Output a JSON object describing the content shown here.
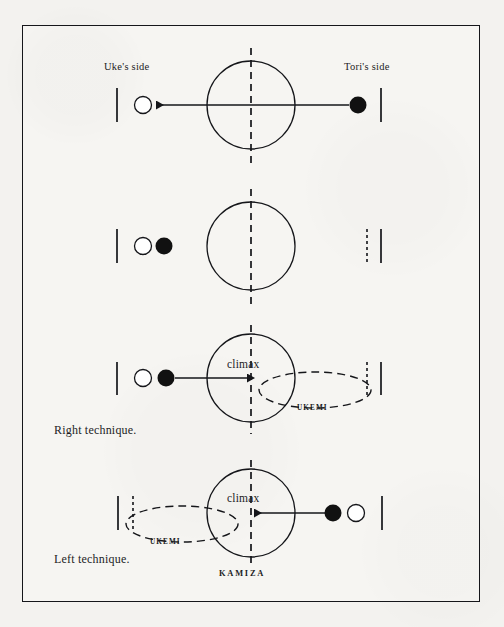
{
  "figure": {
    "title_labels": {
      "uke_side": "Uke's side",
      "tori_side": "Tori's side"
    },
    "colors": {
      "ink": "#15161a",
      "paper": "#f3f2ef",
      "frame": "#15161a",
      "black_marker": "#111111",
      "white_marker": "#ffffff"
    },
    "center_label": "KAMIZA",
    "rows": [
      {
        "id": "row-1",
        "caption": "",
        "climax": "",
        "ukemi": "",
        "arrow_direction": "left",
        "markers": [
          {
            "type": "tick",
            "style": "solid",
            "x": 117
          },
          {
            "type": "circle",
            "fill": "white",
            "x": 143
          },
          {
            "type": "circle",
            "fill": "black",
            "x": 358
          },
          {
            "type": "tick",
            "style": "solid",
            "x": 381
          }
        ]
      },
      {
        "id": "row-2",
        "caption": "",
        "climax": "",
        "ukemi": "",
        "arrow_direction": "none",
        "markers": [
          {
            "type": "tick",
            "style": "solid",
            "x": 117
          },
          {
            "type": "circle",
            "fill": "white",
            "x": 143
          },
          {
            "type": "circle",
            "fill": "black",
            "x": 165
          },
          {
            "type": "tick",
            "style": "dashed",
            "x": 367
          },
          {
            "type": "tick",
            "style": "solid",
            "x": 381
          }
        ]
      },
      {
        "id": "row-3",
        "caption": "Right technique.",
        "climax": "climax",
        "ukemi": "UKEMI",
        "arrow_direction": "right",
        "markers": [
          {
            "type": "tick",
            "style": "solid",
            "x": 117
          },
          {
            "type": "circle",
            "fill": "white",
            "x": 143
          },
          {
            "type": "circle",
            "fill": "black",
            "x": 166
          },
          {
            "type": "ellipse",
            "style": "dashed",
            "x": 315
          },
          {
            "type": "tick",
            "style": "dashed",
            "x": 367
          },
          {
            "type": "tick",
            "style": "solid",
            "x": 381
          }
        ]
      },
      {
        "id": "row-4",
        "caption": "Left technique.",
        "climax": "climax",
        "ukemi": "UKEMI",
        "arrow_direction": "left",
        "markers": [
          {
            "type": "tick",
            "style": "solid",
            "x": 118
          },
          {
            "type": "tick",
            "style": "dashed",
            "x": 133
          },
          {
            "type": "ellipse",
            "style": "dashed",
            "x": 180
          },
          {
            "type": "circle",
            "fill": "black",
            "x": 333
          },
          {
            "type": "circle",
            "fill": "white",
            "x": 356
          },
          {
            "type": "tick",
            "style": "solid",
            "x": 382
          }
        ]
      }
    ]
  }
}
